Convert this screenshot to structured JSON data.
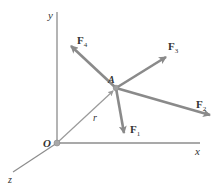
{
  "figure": {
    "type": "force-vector-diagram",
    "colors": {
      "axis": "#8c8c8c",
      "force": "#8a8a8a",
      "position": "#9a9a9a",
      "text": "#333333",
      "point": "#a0a0a0"
    },
    "axes": {
      "x": {
        "label": "x"
      },
      "y": {
        "label": "y"
      },
      "z": {
        "label": "z"
      }
    },
    "origin": {
      "label": "O"
    },
    "point": {
      "label": "A"
    },
    "position_vector": {
      "label": "r"
    },
    "forces": [
      {
        "name": "F",
        "subscript": "1"
      },
      {
        "name": "F",
        "subscript": "2"
      },
      {
        "name": "F",
        "subscript": "3"
      },
      {
        "name": "F",
        "subscript": "4"
      }
    ]
  }
}
